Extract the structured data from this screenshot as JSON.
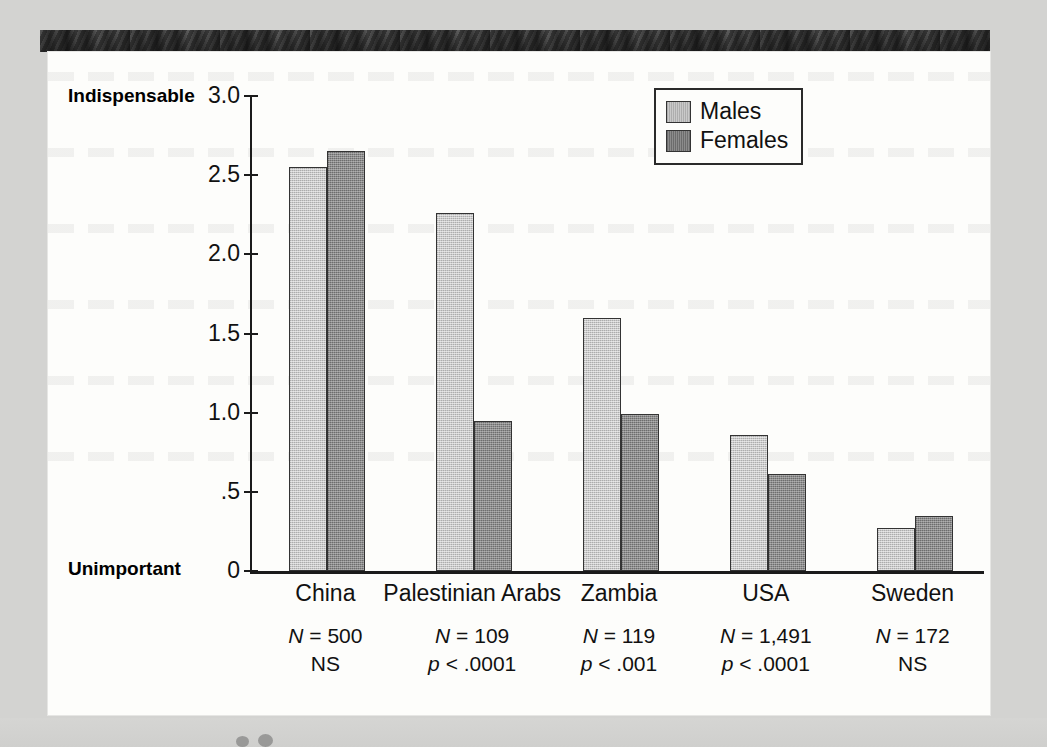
{
  "chart_data": {
    "type": "bar",
    "title": "",
    "xlabel": "",
    "ylabel": "",
    "ylim": [
      0,
      3.0
    ],
    "grid": false,
    "legend_position": "top-right",
    "categories": [
      "China",
      "Palestinian Arabs",
      "Zambia",
      "USA",
      "Sweden"
    ],
    "y_ticks": [
      "0",
      ".5",
      "1.0",
      "1.5",
      "2.0",
      "2.5",
      "3.0"
    ],
    "y_tick_values": [
      0,
      0.5,
      1.0,
      1.5,
      2.0,
      2.5,
      3.0
    ],
    "axis_low_label": "Unimportant",
    "axis_high_label": "Indispensable",
    "series": [
      {
        "name": "Males",
        "color": "#c9c9c9",
        "values": [
          2.55,
          2.26,
          1.6,
          0.86,
          0.27
        ]
      },
      {
        "name": "Females",
        "color": "#8c8c8c",
        "values": [
          2.65,
          0.95,
          0.99,
          0.61,
          0.35
        ]
      }
    ],
    "annotations": [
      {
        "n_label": "N",
        "n_value": "= 500",
        "sig": "NS"
      },
      {
        "n_label": "N",
        "n_value": "= 109",
        "sig": "p < .0001"
      },
      {
        "n_label": "N",
        "n_value": "= 119",
        "sig": "p < .001"
      },
      {
        "n_label": "N",
        "n_value": "= 1,491",
        "sig": "p < .0001"
      },
      {
        "n_label": "N",
        "n_value": "= 172",
        "sig": "NS"
      }
    ]
  },
  "legend": {
    "items": [
      {
        "label": "Males"
      },
      {
        "label": "Females"
      }
    ]
  }
}
